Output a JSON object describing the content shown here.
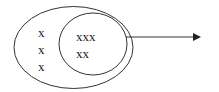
{
  "diagram": {
    "outer_set": {
      "elements": [
        "x",
        "x",
        "x"
      ]
    },
    "inner_set": {
      "elements": [
        "xxx",
        "xx"
      ]
    },
    "arrow": {
      "direction": "right"
    },
    "colors": {
      "stroke": "#333333",
      "text": "#222222",
      "background": "#ffffff"
    }
  }
}
